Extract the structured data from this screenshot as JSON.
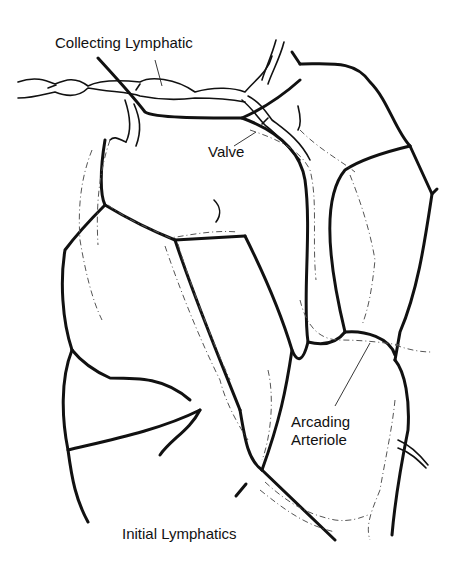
{
  "diagram": {
    "type": "anatomical line illustration",
    "labels": {
      "collecting_lymphatic": "Collecting Lymphatic",
      "valve": "Valve",
      "arcading_arteriole_line1": "Arcading",
      "arcading_arteriole_line2": "Arteriole",
      "initial_lymphatics": "Initial Lymphatics"
    },
    "colors": {
      "line": "#111111",
      "background": "#ffffff",
      "dashed_vessel": "#555555"
    }
  }
}
